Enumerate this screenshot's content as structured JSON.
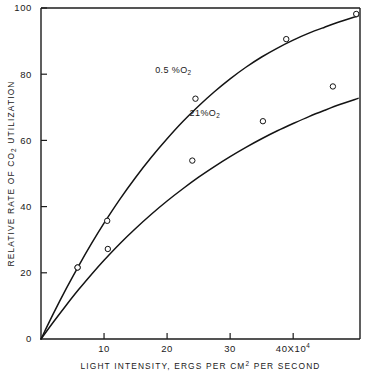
{
  "chart_data": {
    "type": "line",
    "title": "",
    "xlabel": "LIGHT INTENSITY, ERGS PER CM2 PER SECOND",
    "xlabel_parts": {
      "before": "LIGHT INTENSITY, ERGS PER CM",
      "superscript": "2",
      "after": " PER SECOND"
    },
    "ylabel": "RELATIVE RATE OF CO2 UTILIZATION",
    "ylabel_parts": {
      "before": "RELATIVE RATE OF CO",
      "subscript": "2",
      "after": " UTILIZATION"
    },
    "xlim": [
      0,
      50.6
    ],
    "ylim": [
      0,
      100
    ],
    "x_unit_note": "40X10^4",
    "x_tick_values": [
      10,
      20,
      30,
      40
    ],
    "x_tick_labels": [
      "10",
      "20",
      "30",
      "40X10",
      "4"
    ],
    "x_tick_label_last_base": "40X10",
    "x_tick_label_last_exp": "4",
    "y_tick_values": [
      0,
      20,
      40,
      60,
      80,
      100
    ],
    "y_tick_labels": [
      "0",
      "20",
      "40",
      "60",
      "80",
      "100"
    ],
    "grid": false,
    "legend_position": "inline-annotations",
    "series": [
      {
        "name": "0.5 %O2",
        "label_base": "0.5 %O",
        "label_sub": "2",
        "label_x": 21.0,
        "label_y": 80.5,
        "points_x": [
          5.8,
          10.5,
          24.5,
          38.9,
          50.0
        ],
        "points_y": [
          21.6,
          35.7,
          72.6,
          90.6,
          98.2
        ],
        "curve_x": [
          0,
          2,
          4,
          6,
          8,
          10,
          12.5,
          15,
          17.5,
          20,
          22.5,
          25,
          27.5,
          30,
          32.5,
          35,
          37.5,
          40,
          42.5,
          45,
          47.5,
          50.3
        ],
        "curve_y": [
          0,
          7.8,
          15.2,
          22.2,
          28.8,
          35.0,
          42.2,
          48.8,
          54.9,
          60.5,
          65.7,
          70.4,
          74.7,
          78.6,
          82.1,
          85.2,
          87.9,
          90.3,
          92.4,
          94.2,
          95.9,
          97.6
        ]
      },
      {
        "name": "21%O2",
        "label_base": "21%O",
        "label_sub": "2",
        "label_x": 26.0,
        "label_y": 67.5,
        "points_x": [
          5.8,
          10.6,
          24.0,
          35.2,
          46.3
        ],
        "points_y": [
          21.6,
          27.2,
          53.9,
          65.8,
          76.3
        ],
        "curve_x": [
          0,
          2,
          4,
          6,
          8,
          10,
          12.5,
          15,
          17.5,
          20,
          22.5,
          25,
          27.5,
          30,
          32.5,
          35,
          37.5,
          40,
          42.5,
          45,
          47.5,
          50.3
        ],
        "curve_y": [
          0,
          5.2,
          10.2,
          15.0,
          19.5,
          23.8,
          28.8,
          33.4,
          37.7,
          41.7,
          45.4,
          48.9,
          52.1,
          55.1,
          57.9,
          60.5,
          62.9,
          65.1,
          67.2,
          69.1,
          70.9,
          72.7
        ]
      }
    ]
  }
}
